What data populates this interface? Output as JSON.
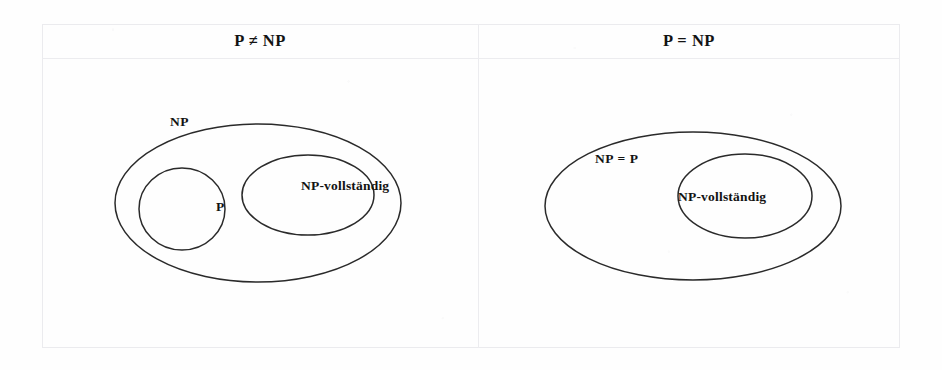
{
  "figure": {
    "type": "venn-diagram-pair",
    "columns": [
      {
        "header": "P ≠ NP",
        "sets": [
          {
            "name": "NP",
            "label": "NP",
            "role": "outer"
          },
          {
            "name": "P",
            "label": "P",
            "role": "inner"
          },
          {
            "name": "NP-vollstaendig",
            "label": "NP-vollständig",
            "role": "inner"
          }
        ]
      },
      {
        "header": "P = NP",
        "sets": [
          {
            "name": "NP-equals-P",
            "label": "NP = P",
            "role": "outer"
          },
          {
            "name": "NP-vollstaendig",
            "label": "NP-vollständig",
            "role": "inner"
          }
        ]
      }
    ]
  },
  "colors": {
    "stroke": "#2a2a2a",
    "text": "#131313",
    "rule": "#ececef",
    "background": "#fefefe"
  }
}
